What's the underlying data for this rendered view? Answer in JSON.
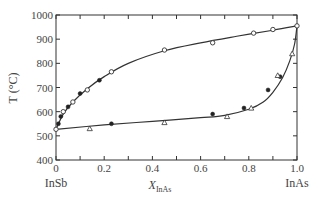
{
  "chart_data": {
    "type": "scatter",
    "title": "",
    "xlabel": "X",
    "xlabel_subscript": "InAs",
    "ylabel": "T (°C)",
    "xlim": [
      0,
      1.0
    ],
    "ylim": [
      400,
      1000
    ],
    "grid": false,
    "legend": null,
    "x_ticks": [
      "0",
      "0.2",
      "0.4",
      "0.6",
      "0.8",
      "1.0"
    ],
    "y_ticks": [
      "400",
      "500",
      "600",
      "700",
      "800",
      "900",
      "1000"
    ],
    "x_end_labels": {
      "left": "InSb",
      "right": "InAs"
    },
    "curves": [
      {
        "name": "liquidus",
        "x": [
          0,
          0.03,
          0.07,
          0.13,
          0.2,
          0.3,
          0.45,
          0.6,
          0.75,
          0.9,
          1.0
        ],
        "y": [
          527,
          590,
          640,
          695,
          745,
          800,
          852,
          885,
          912,
          937,
          955
        ]
      },
      {
        "name": "solidus",
        "x": [
          0,
          0.2,
          0.4,
          0.6,
          0.7,
          0.8,
          0.86,
          0.9,
          0.94,
          0.97,
          0.99,
          1.0
        ],
        "y": [
          527,
          545,
          560,
          575,
          585,
          610,
          640,
          680,
          740,
          810,
          880,
          955
        ]
      }
    ],
    "series": [
      {
        "name": "open circles",
        "marker": "circle-open",
        "x": [
          0,
          0.03,
          0.07,
          0.13,
          0.23,
          0.45,
          0.65,
          0.82,
          0.9,
          1.0
        ],
        "y": [
          527,
          600,
          640,
          690,
          765,
          855,
          885,
          925,
          940,
          955
        ]
      },
      {
        "name": "filled circles",
        "marker": "circle-filled",
        "x": [
          0.01,
          0.02,
          0.05,
          0.1,
          0.18,
          0.23,
          0.65,
          0.78,
          0.88,
          0.93
        ],
        "y": [
          550,
          580,
          620,
          675,
          730,
          550,
          590,
          615,
          690,
          745
        ]
      },
      {
        "name": "open triangles",
        "marker": "triangle-open",
        "x": [
          0.14,
          0.45,
          0.71,
          0.81,
          0.92,
          0.98
        ],
        "y": [
          530,
          555,
          580,
          615,
          750,
          840
        ]
      }
    ]
  }
}
